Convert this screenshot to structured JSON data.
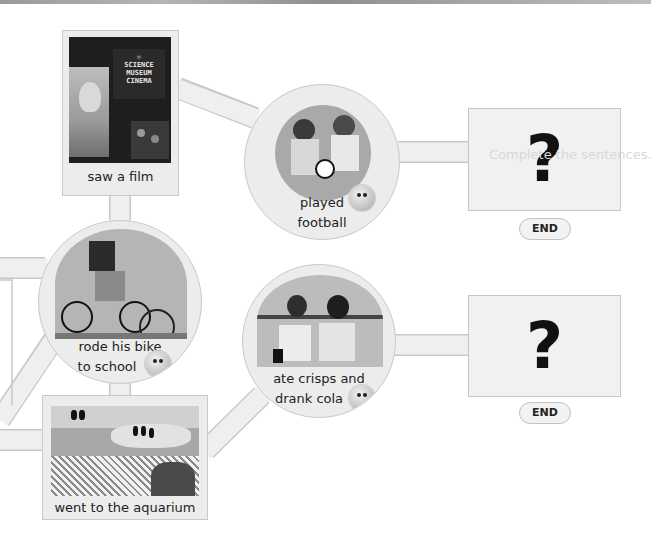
{
  "story_map": {
    "nodes": {
      "film": {
        "caption": "saw a film",
        "sign_lines": [
          "SCIENCE",
          "MUSEUM",
          "CINEMA"
        ]
      },
      "football": {
        "caption_line1": "played",
        "caption_line2": "football"
      },
      "bike": {
        "caption_line1": "rode his bike",
        "caption_line2": "to school"
      },
      "crisps": {
        "caption_line1": "ate crisps and",
        "caption_line2": "drank cola"
      },
      "aquarium": {
        "caption": "went to the aquarium"
      }
    },
    "endings": [
      {
        "mark": "?",
        "button_label": "END"
      },
      {
        "mark": "?",
        "button_label": "END"
      }
    ],
    "ghost_text": "Complete the sentences."
  },
  "colors": {
    "path_fill": "#efefef",
    "path_border": "#c9c9c9",
    "background": "#ffffff",
    "text": "#222222"
  }
}
